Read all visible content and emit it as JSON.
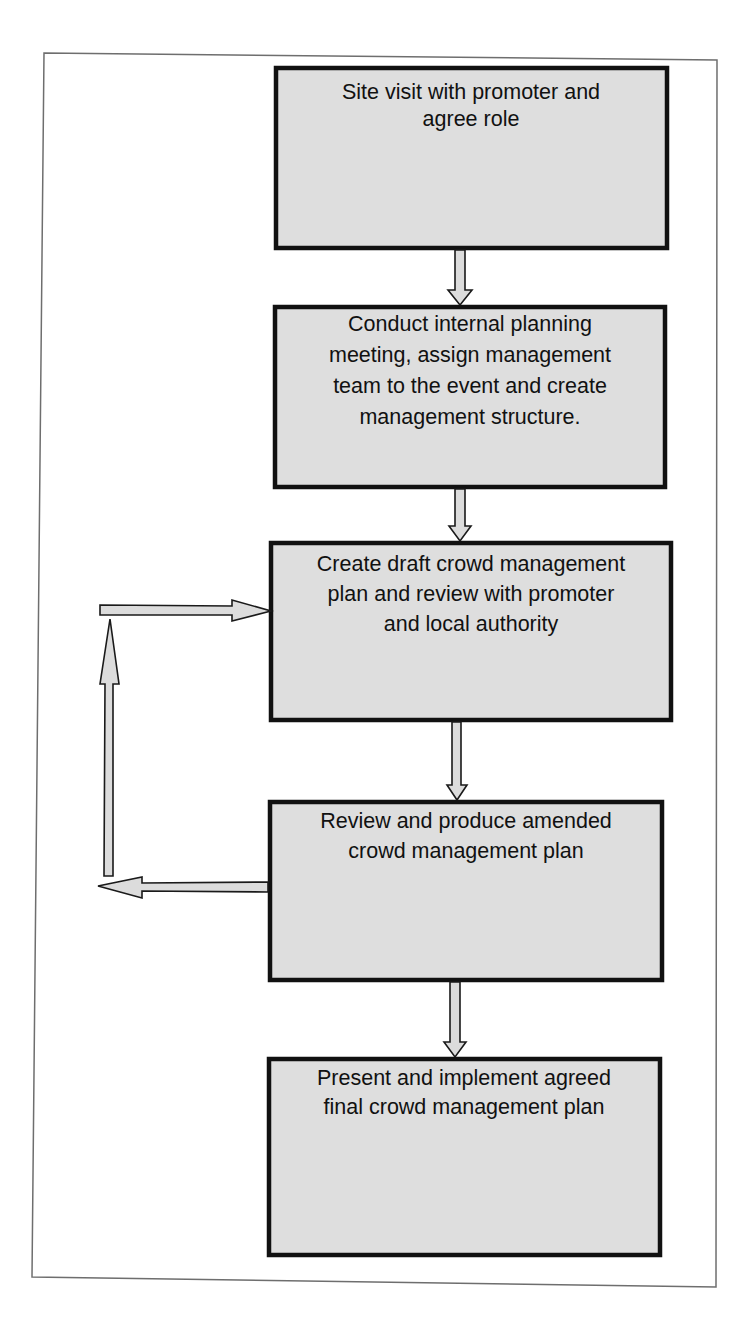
{
  "diagram": {
    "type": "flowchart",
    "steps": [
      {
        "id": "step1",
        "lines": [
          "Site visit with promoter and",
          "agree role"
        ]
      },
      {
        "id": "step2",
        "lines": [
          "Conduct internal planning",
          "meeting, assign management",
          "team to the event and create",
          "management structure."
        ]
      },
      {
        "id": "step3",
        "lines": [
          "Create draft crowd management",
          "plan and review with promoter",
          "and local authority"
        ]
      },
      {
        "id": "step4",
        "lines": [
          "Review and produce amended",
          "crowd management plan"
        ]
      },
      {
        "id": "step5",
        "lines": [
          "Present and implement agreed",
          "final crowd management plan"
        ]
      }
    ],
    "connections": [
      {
        "from": "step1",
        "to": "step2"
      },
      {
        "from": "step2",
        "to": "step3"
      },
      {
        "from": "step3",
        "to": "step4"
      },
      {
        "from": "step4",
        "to": "step5"
      },
      {
        "from": "step4",
        "to": "step3",
        "type": "feedback-loop"
      }
    ],
    "colors": {
      "box_fill": "#dedede",
      "box_border": "#111111",
      "arrow_fill": "#dcdcdc",
      "frame": "#6e6e6e"
    }
  }
}
